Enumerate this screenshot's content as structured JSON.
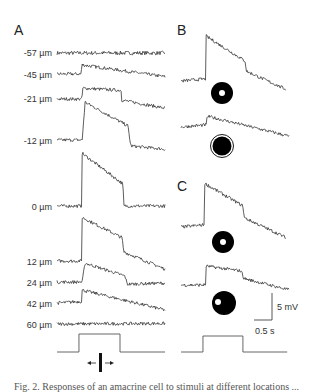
{
  "figure": {
    "panels": {
      "A": {
        "label": "A",
        "traces": [
          {
            "depth": "-57 µm",
            "points": [
              [
                0,
                0
              ],
              [
                3.0,
                0
              ]
            ],
            "noise": 0.35
          },
          {
            "depth": "-45 µm",
            "points": [
              [
                0,
                0
              ],
              [
                0.67,
                0
              ],
              [
                0.69,
                1.7
              ],
              [
                3.0,
                -0.5
              ]
            ],
            "noise": 0.3
          },
          {
            "depth": "-21 µm",
            "points": [
              [
                0,
                0
              ],
              [
                0.69,
                0
              ],
              [
                0.72,
                2.0
              ],
              [
                1.78,
                1.6
              ],
              [
                1.8,
                -0.2
              ],
              [
                3.0,
                -1.7
              ]
            ],
            "noise": 0.3
          },
          {
            "depth": "-12 µm",
            "points": [
              [
                0,
                0
              ],
              [
                0.7,
                0
              ],
              [
                0.78,
                7.0
              ],
              [
                1.97,
                2.6
              ],
              [
                2.05,
                -1.1
              ],
              [
                3.0,
                -1.7
              ]
            ],
            "noise": 0.3
          },
          {
            "depth": "0 µm",
            "points": [
              [
                0,
                0
              ],
              [
                0.68,
                0
              ],
              [
                0.69,
                9.8
              ],
              [
                1.83,
                4.1
              ],
              [
                1.86,
                0
              ],
              [
                3.0,
                0
              ]
            ],
            "noise": 0.3
          },
          {
            "depth": "12 µm",
            "points": [
              [
                0,
                0
              ],
              [
                0.68,
                0
              ],
              [
                0.69,
                8.1
              ],
              [
                1.81,
                4.3
              ],
              [
                1.85,
                1.7
              ],
              [
                3.0,
                -1.5
              ]
            ],
            "noise": 0.3
          },
          {
            "depth": "24 µm",
            "points": [
              [
                0,
                0
              ],
              [
                0.7,
                0
              ],
              [
                0.78,
                3.5
              ],
              [
                1.89,
                1.1
              ],
              [
                1.95,
                -0.4
              ],
              [
                3.0,
                -0.2
              ]
            ],
            "noise": 0.3
          },
          {
            "depth": "42 µm",
            "points": [
              [
                0,
                0
              ],
              [
                0.68,
                0.3
              ],
              [
                0.69,
                2.4
              ],
              [
                3.0,
                -1.3
              ]
            ],
            "noise": 0.3
          },
          {
            "depth": "60 µm",
            "points": [
              [
                0,
                0
              ],
              [
                3.0,
                0.1
              ]
            ],
            "noise": 0.3
          }
        ],
        "stimulus": {
          "on": 0.61,
          "off": 1.75,
          "duration": 3.0
        },
        "stimulus_icon": "moving-bar-icon"
      },
      "B": {
        "label": "B",
        "traces": [
          {
            "condition": "annulus-small-center-hole",
            "points": [
              [
                0,
                0
              ],
              [
                0.68,
                0.4
              ],
              [
                0.7,
                8.3
              ],
              [
                1.78,
                3.7
              ],
              [
                1.82,
                1.8
              ],
              [
                2.9,
                -1.5
              ]
            ],
            "noise": 0.3,
            "icon": "annulus-icon"
          },
          {
            "condition": "disk-with-surround-ring",
            "points": [
              [
                0,
                0
              ],
              [
                0.7,
                0.4
              ],
              [
                0.73,
                2.0
              ],
              [
                3.0,
                -1.7
              ]
            ],
            "noise": 0.3,
            "icon": "ringed-disk-icon"
          }
        ]
      },
      "C": {
        "label": "C",
        "traces": [
          {
            "condition": "annulus-centered-spot",
            "points": [
              [
                0,
                0
              ],
              [
                0.64,
                0.4
              ],
              [
                0.65,
                8.1
              ],
              [
                1.72,
                3.9
              ],
              [
                1.76,
                1.7
              ],
              [
                2.9,
                -1.9
              ]
            ],
            "noise": 0.3,
            "icon": "annulus-icon"
          },
          {
            "condition": "disk-offset-spot",
            "points": [
              [
                0,
                0
              ],
              [
                0.69,
                0
              ],
              [
                0.7,
                3.5
              ],
              [
                1.67,
                2.6
              ],
              [
                1.75,
                1.2
              ],
              [
                3.0,
                -0.9
              ]
            ],
            "noise": 0.3,
            "icon": "offset-spot-disk-icon"
          }
        ],
        "stimulus": {
          "on": 0.61,
          "off": 1.72,
          "duration": 2.95
        }
      }
    },
    "scale_bar": {
      "voltage": 5,
      "voltage_label": "5 mV",
      "time": 0.5,
      "time_label": "0.5 s"
    },
    "caption_fragment": "Fig. 2. Responses of an amacrine cell to stimuli at different locations ..."
  }
}
